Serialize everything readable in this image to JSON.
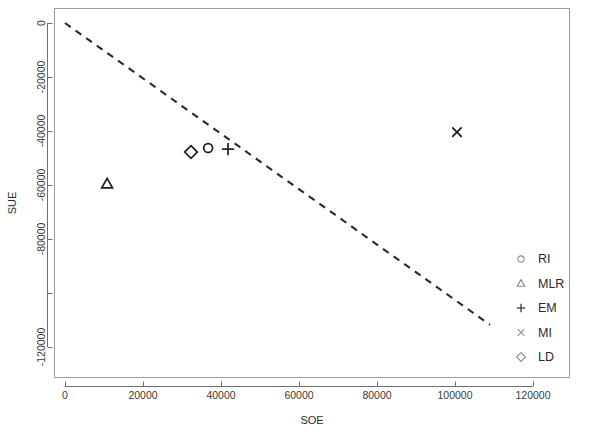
{
  "chart_data": {
    "type": "scatter",
    "title": "",
    "xlabel": "SOE",
    "ylabel": "SUE",
    "xlim": [
      -6000,
      132000
    ],
    "ylim": [
      -132000,
      4000
    ],
    "grid": false,
    "legend_position": "bottom-right",
    "x_ticks": [
      0,
      20000,
      40000,
      60000,
      80000,
      100000,
      120000
    ],
    "x_tick_labels": [
      "0",
      "20000",
      "40000",
      "60000",
      "80000",
      "100000",
      "120000"
    ],
    "y_ticks": [
      0,
      -20000,
      -40000,
      -60000,
      -80000,
      -100000,
      -120000
    ],
    "y_tick_labels": [
      "0",
      "-20000",
      "-40000",
      "-60000",
      "-80000",
      "",
      "-120000"
    ],
    "series": [
      {
        "name": "RI",
        "marker": "circle",
        "x": 36700,
        "y": -46300
      },
      {
        "name": "MLR",
        "marker": "triangle",
        "x": 10800,
        "y": -59600
      },
      {
        "name": "EM",
        "marker": "plus",
        "x": 41800,
        "y": -46700
      },
      {
        "name": "MI",
        "marker": "cross",
        "x": 100500,
        "y": -40400
      },
      {
        "name": "LD",
        "marker": "diamond",
        "x": 32300,
        "y": -47800
      }
    ],
    "reference_line": {
      "style": "dashed",
      "x_start": 0,
      "y_start": 0,
      "x_end": 109000,
      "y_end": -111800
    },
    "legend": [
      {
        "label": "RI",
        "marker": "circle"
      },
      {
        "label": "MLR",
        "marker": "triangle"
      },
      {
        "label": "EM",
        "marker": "plus"
      },
      {
        "label": "MI",
        "marker": "cross"
      },
      {
        "label": "LD",
        "marker": "diamond"
      }
    ],
    "colors": {
      "marker": "#1c1c1c",
      "line": "#2a2a2a",
      "axis": "#6f6f6f",
      "frame": "#9a9a9a",
      "text": "#2b2b2b",
      "background": "#ffffff"
    }
  }
}
